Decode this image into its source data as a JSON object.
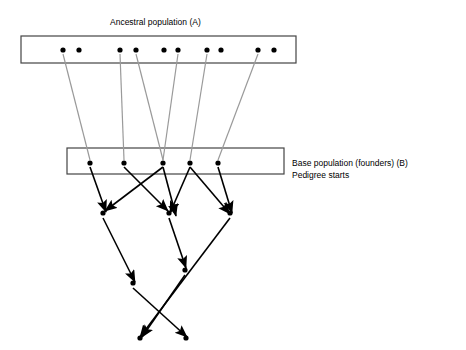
{
  "diagram": {
    "type": "pedigree-diagram",
    "background_color": "#ffffff",
    "labels": {
      "ancestral_title": "Ancestral population (A)",
      "base_title": "Base population (founders) (B)",
      "base_subtitle": "Pedigree starts"
    },
    "boxes": [
      {
        "name": "ancestral-population-box",
        "x": 21,
        "y": 36,
        "width": 275,
        "height": 27,
        "stroke": "#444444"
      },
      {
        "name": "base-population-box",
        "x": 67,
        "y": 148,
        "width": 217,
        "height": 26,
        "stroke": "#444444"
      }
    ],
    "ancestral_individuals": [
      {
        "x": 63,
        "y": 50
      },
      {
        "x": 79,
        "y": 50
      },
      {
        "x": 120,
        "y": 50
      },
      {
        "x": 136,
        "y": 50
      },
      {
        "x": 164,
        "y": 50
      },
      {
        "x": 178,
        "y": 50
      },
      {
        "x": 207,
        "y": 50
      },
      {
        "x": 221,
        "y": 50
      },
      {
        "x": 258,
        "y": 50
      },
      {
        "x": 274,
        "y": 50
      }
    ],
    "founder_individuals": [
      {
        "x": 90,
        "y": 163
      },
      {
        "x": 124,
        "y": 163
      },
      {
        "x": 163,
        "y": 163
      },
      {
        "x": 190,
        "y": 163
      },
      {
        "x": 218,
        "y": 163
      }
    ],
    "descendant_individuals": [
      {
        "x": 103,
        "y": 213
      },
      {
        "x": 169,
        "y": 213
      },
      {
        "x": 230,
        "y": 213
      },
      {
        "x": 133,
        "y": 283
      },
      {
        "x": 185,
        "y": 270
      },
      {
        "x": 140,
        "y": 338
      },
      {
        "x": 186,
        "y": 338
      }
    ],
    "gray_links": [
      {
        "from": [
          63,
          54
        ],
        "to": [
          90,
          160
        ]
      },
      {
        "from": [
          120,
          54
        ],
        "to": [
          124,
          160
        ]
      },
      {
        "from": [
          136,
          54
        ],
        "to": [
          163,
          160
        ]
      },
      {
        "from": [
          178,
          54
        ],
        "to": [
          163,
          160
        ]
      },
      {
        "from": [
          207,
          54
        ],
        "to": [
          190,
          160
        ]
      },
      {
        "from": [
          258,
          54
        ],
        "to": [
          218,
          160
        ]
      }
    ],
    "pedigree_arrows": [
      {
        "from": [
          90,
          167
        ],
        "to": [
          106,
          212
        ]
      },
      {
        "from": [
          124,
          167
        ],
        "to": [
          168,
          211
        ]
      },
      {
        "from": [
          163,
          167
        ],
        "to": [
          105,
          211
        ]
      },
      {
        "from": [
          163,
          167
        ],
        "to": [
          176,
          216
        ]
      },
      {
        "from": [
          190,
          167
        ],
        "to": [
          170,
          213
        ]
      },
      {
        "from": [
          190,
          167
        ],
        "to": [
          230,
          214
        ]
      },
      {
        "from": [
          218,
          167
        ],
        "to": [
          232,
          213
        ]
      },
      {
        "from": [
          103,
          218
        ],
        "to": [
          135,
          282
        ]
      },
      {
        "from": [
          169,
          218
        ],
        "to": [
          186,
          268
        ]
      },
      {
        "from": [
          230,
          218
        ],
        "to": [
          140,
          337
        ]
      },
      {
        "from": [
          133,
          288
        ],
        "to": [
          187,
          337
        ]
      },
      {
        "from": [
          185,
          275
        ],
        "to": [
          142,
          337
        ]
      }
    ],
    "colors": {
      "node": "#000000",
      "gray_link": "#9a9a9a",
      "arrow": "#000000",
      "box_stroke": "#444444",
      "text": "#000000"
    }
  }
}
